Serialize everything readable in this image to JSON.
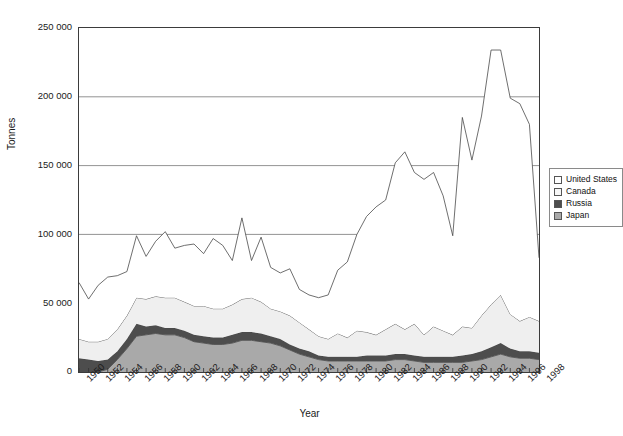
{
  "chart_data": {
    "type": "area",
    "stacked": true,
    "title": "",
    "xlabel": "Year",
    "ylabel": "Tonnes",
    "ylim": [
      0,
      250000
    ],
    "ytick_step": 50000,
    "ytick_labels": [
      "250 000",
      "200 000",
      "150 000",
      "100 000",
      "50 000",
      "0"
    ],
    "ytick_values": [
      250000,
      200000,
      150000,
      100000,
      50000,
      0
    ],
    "grid": "horizontal",
    "legend_position": "right",
    "xtick_labels": [
      "1950",
      "1952",
      "1954",
      "1956",
      "1958",
      "1960",
      "1962",
      "1964",
      "1966",
      "1968",
      "1970",
      "1972",
      "1974",
      "1976",
      "1978",
      "1980",
      "1982",
      "1984",
      "1986",
      "1988",
      "1990",
      "1992",
      "1994",
      "1996",
      "1998"
    ],
    "x": [
      1950,
      1951,
      1952,
      1953,
      1954,
      1955,
      1956,
      1957,
      1958,
      1959,
      1960,
      1961,
      1962,
      1963,
      1964,
      1965,
      1966,
      1967,
      1968,
      1969,
      1970,
      1971,
      1972,
      1973,
      1974,
      1975,
      1976,
      1977,
      1978,
      1979,
      1980,
      1981,
      1982,
      1983,
      1984,
      1985,
      1986,
      1987,
      1988,
      1989,
      1990,
      1991,
      1992,
      1993,
      1994,
      1995,
      1996,
      1997,
      1998
    ],
    "series": [
      {
        "name": "Japan",
        "color": "#a9a9a9",
        "stack_order": 1,
        "values": [
          0,
          0,
          0,
          2000,
          9000,
          17000,
          26000,
          27000,
          28000,
          27000,
          27000,
          25000,
          22000,
          21000,
          20000,
          20000,
          21000,
          23000,
          23000,
          22000,
          21000,
          19000,
          16000,
          13000,
          11000,
          9000,
          8000,
          8000,
          8000,
          8000,
          8000,
          8000,
          8000,
          9000,
          9000,
          8000,
          7000,
          7000,
          7000,
          7000,
          7000,
          8000,
          9000,
          11000,
          13000,
          11000,
          10000,
          10000,
          9000
        ]
      },
      {
        "name": "Russia",
        "color": "#4d4d4d",
        "stack_order": 2,
        "values": [
          10000,
          9000,
          8000,
          7000,
          6000,
          7000,
          9000,
          6000,
          6000,
          5000,
          5000,
          5000,
          5000,
          5000,
          5000,
          5000,
          6000,
          6000,
          6000,
          6000,
          5000,
          5000,
          4000,
          4000,
          4000,
          3000,
          3000,
          3000,
          3000,
          3000,
          4000,
          4000,
          4000,
          4000,
          4000,
          4000,
          4000,
          4000,
          4000,
          4000,
          5000,
          5000,
          6000,
          7000,
          8000,
          6000,
          5000,
          5000,
          5000
        ]
      },
      {
        "name": "Canada",
        "color": "#efefef",
        "stack_order": 3,
        "values": [
          14000,
          13000,
          14000,
          15000,
          16000,
          17000,
          19000,
          20000,
          21000,
          22000,
          22000,
          21000,
          21000,
          22000,
          21000,
          21000,
          22000,
          24000,
          25000,
          23000,
          20000,
          20000,
          21000,
          19000,
          16000,
          14000,
          13000,
          17000,
          14000,
          19000,
          17000,
          15000,
          19000,
          22000,
          18000,
          23000,
          16000,
          22000,
          19000,
          16000,
          21000,
          19000,
          26000,
          31000,
          35000,
          25000,
          22000,
          25000,
          23000
        ]
      },
      {
        "name": "United States",
        "color": "#ffffff",
        "stack_order": 4,
        "values": [
          41000,
          31000,
          41000,
          45000,
          39000,
          32000,
          45000,
          31000,
          40000,
          48000,
          36000,
          41000,
          45000,
          38000,
          51000,
          46000,
          32000,
          59000,
          27000,
          47000,
          30000,
          28000,
          34000,
          24000,
          25000,
          28000,
          32000,
          46000,
          55000,
          70000,
          84000,
          93000,
          94000,
          117000,
          129000,
          110000,
          113000,
          112000,
          98000,
          72000,
          152000,
          122000,
          145000,
          185000,
          178000,
          157000,
          158000,
          140000,
          46000
        ]
      }
    ],
    "stack_totals_note": "Totals shown are the sum of Japan + Russia + Canada + United States"
  },
  "legend": {
    "items": [
      {
        "label": "United States",
        "color": "#ffffff"
      },
      {
        "label": "Canada",
        "color": "#f2f2f2"
      },
      {
        "label": "Russia",
        "color": "#4d4d4d"
      },
      {
        "label": "Japan",
        "color": "#a9a9a9"
      }
    ]
  },
  "axes": {
    "y_title": "Tonnes",
    "x_title": "Year"
  }
}
